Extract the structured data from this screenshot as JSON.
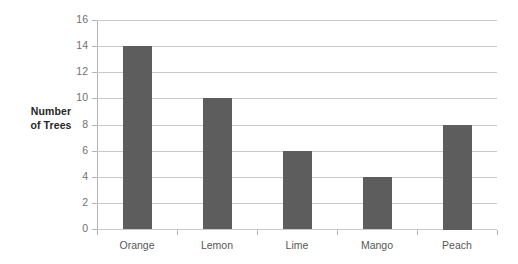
{
  "chart_data": {
    "type": "bar",
    "title": "",
    "categories": [
      "Orange",
      "Lemon",
      "Lime",
      "Mango",
      "Peach"
    ],
    "values": [
      14,
      10,
      6,
      4,
      8
    ],
    "series": [
      {
        "name": "Number of Trees",
        "values": [
          14,
          10,
          6,
          4,
          8
        ]
      }
    ],
    "xlabel": "",
    "ylabel": "Number of Trees",
    "ylabel_lines": [
      "Number",
      "of Trees"
    ],
    "ylim": [
      0,
      16
    ],
    "ytick_step": 2,
    "yticks": [
      16,
      14,
      12,
      10,
      8,
      6,
      4,
      2,
      0
    ],
    "ytick_labels": [
      "16",
      "14",
      "12",
      "10",
      "8",
      "6",
      "4",
      "2",
      "0"
    ],
    "grid": true,
    "grid_axis": "y",
    "legend": false,
    "legend_position": "none",
    "bar_color": "#5d5d5d",
    "gridline_color": "#c9c9c9",
    "axis_color": "#9a9a9a",
    "tick_label_color": "#6f6f6f",
    "category_label_color": "#575757",
    "axis_title_color": "#262626",
    "background_color": "#ffffff"
  }
}
